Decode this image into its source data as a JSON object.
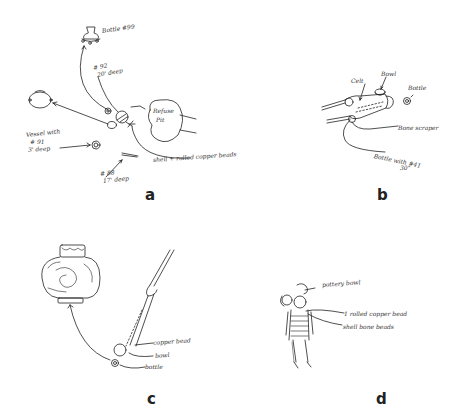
{
  "figure": {
    "panels": [
      {
        "id": "a",
        "letter": "a",
        "labels": {
          "bottle": "Bottle #99",
          "depth1": "# 92",
          "depth1b": "20' deep",
          "refuse_pit": "Refuse",
          "refuse_pit_b": "Pit",
          "vessel1": "Vessel with",
          "vessel1b": "# 91",
          "vessel1c": "3' deep",
          "beads": "shell + rolled copper beads",
          "depth2": "# 88",
          "depth2b": "17' deep"
        }
      },
      {
        "id": "b",
        "letter": "b",
        "labels": {
          "celt": "Celt",
          "bowl": "Bowl",
          "bottle": "Bottle",
          "scraper": "Bone scraper",
          "bottle_with": "Bottle with #41",
          "depth": "30\""
        }
      },
      {
        "id": "c",
        "letter": "c",
        "labels": {
          "copper_bead": "copper bead",
          "bowl": "bowl",
          "bottle": "bottle"
        }
      },
      {
        "id": "d",
        "letter": "d",
        "labels": {
          "pottery": "pottery bowl",
          "copper_bead": "1 rolled copper bead",
          "shell_beads": "shell bone beads"
        }
      }
    ]
  }
}
